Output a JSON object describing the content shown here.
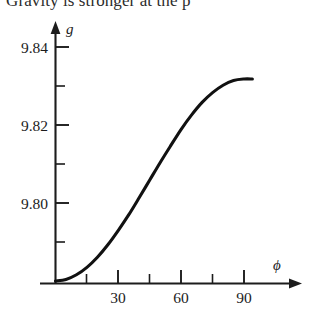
{
  "caption": {
    "text": "Gravity is stronger at the p"
  },
  "chart_data": {
    "type": "line",
    "title": "Gravity is stronger at the p",
    "xlabel": "ϕ",
    "ylabel": "g",
    "xlim": [
      0,
      98
    ],
    "ylim": [
      9.7735,
      9.8455
    ],
    "grid": false,
    "legend": null,
    "x_ticks": [
      30,
      60,
      90
    ],
    "x_tick_labels": [
      "30",
      "60",
      "90"
    ],
    "x_minor_ticks": [
      15,
      45,
      75
    ],
    "y_ticks": [
      9.8,
      9.82,
      9.84
    ],
    "y_tick_labels": [
      "9.80",
      "9.82",
      "9.84"
    ],
    "y_minor_ticks": [
      9.785,
      9.79,
      9.795,
      9.805,
      9.81,
      9.815,
      9.825,
      9.83,
      9.835
    ],
    "series": [
      {
        "name": "g vs latitude",
        "color": "#111111",
        "x": [
          0,
          5,
          10,
          15,
          20,
          25,
          30,
          35,
          40,
          45,
          50,
          55,
          60,
          65,
          70,
          75,
          80,
          85,
          90,
          94
        ],
        "values": [
          9.78,
          9.7804,
          9.7816,
          9.7835,
          9.7861,
          9.7893,
          9.793,
          9.797,
          9.8014,
          9.8059,
          9.8104,
          9.8147,
          9.8189,
          9.8226,
          9.8258,
          9.8283,
          9.8302,
          9.8314,
          9.8318,
          9.8318
        ]
      }
    ]
  },
  "axes": {
    "y_axis_symbol": "g",
    "x_axis_symbol": "ϕ"
  }
}
